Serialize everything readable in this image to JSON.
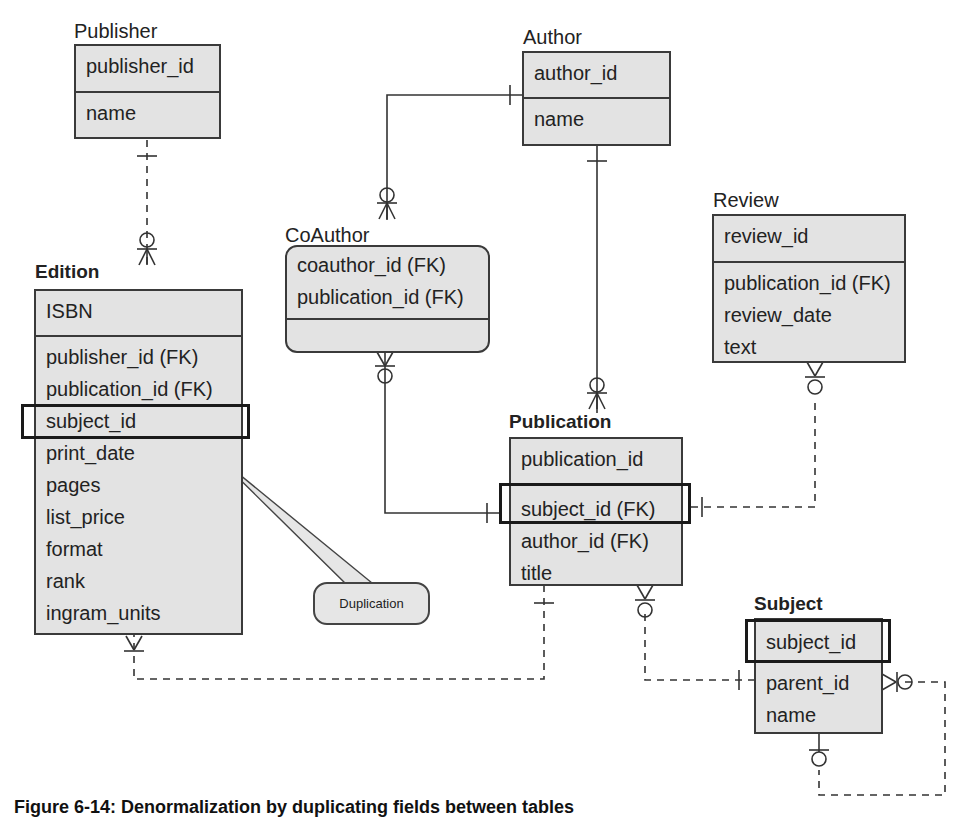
{
  "diagram": {
    "type": "entity-relationship",
    "notation": "crow's foot",
    "highlight_color": "#1a1a1a",
    "entity_fill": "#e3e3e3"
  },
  "entities": {
    "publisher": {
      "name": "Publisher",
      "pk": [
        "publisher_id"
      ],
      "fields": [
        "name"
      ]
    },
    "author": {
      "name": "Author",
      "pk": [
        "author_id"
      ],
      "fields": [
        "name"
      ]
    },
    "coauthor": {
      "name": "CoAuthor",
      "pk": [
        "coauthor_id (FK)",
        "publication_id (FK)"
      ],
      "fields": []
    },
    "review": {
      "name": "Review",
      "pk": [
        "review_id"
      ],
      "fields": [
        "publication_id (FK)",
        "review_date",
        "text"
      ]
    },
    "edition": {
      "name": "Edition",
      "pk": [
        "ISBN"
      ],
      "fields": [
        "publisher_id (FK)",
        "publication_id (FK)",
        "subject_id",
        "print_date",
        "pages",
        "list_price",
        "format",
        "rank",
        "ingram_units"
      ]
    },
    "publication": {
      "name": "Publication",
      "pk": [
        "publication_id"
      ],
      "fields": [
        "subject_id (FK)",
        "author_id (FK)",
        "title"
      ]
    },
    "subject": {
      "name": "Subject",
      "pk": [
        "subject_id"
      ],
      "fields": [
        "parent_id",
        "name"
      ]
    }
  },
  "relationships": [
    {
      "from": "Publisher",
      "to": "Edition",
      "style": "dashed",
      "from_card": "one",
      "to_card": "zero-or-many"
    },
    {
      "from": "Author",
      "to": "CoAuthor",
      "style": "solid",
      "from_card": "one",
      "to_card": "zero-or-many"
    },
    {
      "from": "Author",
      "to": "Publication",
      "style": "solid",
      "from_card": "one",
      "to_card": "zero-or-many"
    },
    {
      "from": "Publication",
      "to": "CoAuthor",
      "style": "solid",
      "from_card": "one",
      "to_card": "zero-or-many"
    },
    {
      "from": "Publication",
      "to": "Review",
      "style": "dashed",
      "from_card": "one",
      "to_card": "zero-or-many"
    },
    {
      "from": "Publication",
      "to": "Edition",
      "style": "dashed",
      "from_card": "one",
      "to_card": "one-or-many"
    },
    {
      "from": "Subject",
      "to": "Publication",
      "style": "dashed",
      "from_card": "one",
      "to_card": "zero-or-many"
    },
    {
      "from": "Subject",
      "to": "Subject",
      "style": "dashed",
      "from_card": "zero-or-one",
      "to_card": "zero-or-many"
    }
  ],
  "callout": {
    "text": "Duplication"
  },
  "caption": "Figure 6-14: Denormalization by duplicating fields between tables"
}
